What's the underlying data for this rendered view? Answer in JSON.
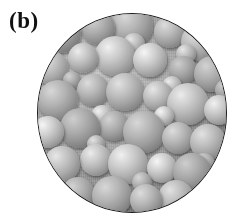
{
  "figure": {
    "panel_label": "(b)",
    "image_type": "circular micrograph of close-packed spherical nanoparticles",
    "background_color": "#ffffff",
    "border_color": "#1d1d1d",
    "circle": {
      "left": 37,
      "top": 13,
      "width": 190,
      "height": 200
    },
    "grayscale": {
      "highlight": "#e2e2e2",
      "midtone": "#a4a4a4",
      "shadow": "#575757",
      "substrate": "#9a9a9a"
    },
    "lighting": "upper-left",
    "particles": [
      {
        "cx": 26,
        "cy": 22,
        "r": 19
      },
      {
        "cx": 62,
        "cy": 16,
        "r": 17
      },
      {
        "cx": 96,
        "cy": 14,
        "r": 21
      },
      {
        "cx": 134,
        "cy": 20,
        "r": 16
      },
      {
        "cx": 164,
        "cy": 30,
        "r": 19
      },
      {
        "cx": 15,
        "cy": 56,
        "r": 17
      },
      {
        "cx": 47,
        "cy": 46,
        "r": 15
      },
      {
        "cx": 79,
        "cy": 44,
        "r": 20
      },
      {
        "cx": 114,
        "cy": 48,
        "r": 17
      },
      {
        "cx": 147,
        "cy": 58,
        "r": 14
      },
      {
        "cx": 176,
        "cy": 62,
        "r": 18
      },
      {
        "cx": 22,
        "cy": 88,
        "r": 20
      },
      {
        "cx": 57,
        "cy": 78,
        "r": 16
      },
      {
        "cx": 89,
        "cy": 80,
        "r": 19
      },
      {
        "cx": 122,
        "cy": 84,
        "r": 15
      },
      {
        "cx": 152,
        "cy": 92,
        "r": 21
      },
      {
        "cx": 183,
        "cy": 98,
        "r": 15
      },
      {
        "cx": 12,
        "cy": 120,
        "r": 16
      },
      {
        "cx": 44,
        "cy": 116,
        "r": 20
      },
      {
        "cx": 78,
        "cy": 114,
        "r": 15
      },
      {
        "cx": 108,
        "cy": 120,
        "r": 21
      },
      {
        "cx": 142,
        "cy": 126,
        "r": 16
      },
      {
        "cx": 172,
        "cy": 130,
        "r": 18
      },
      {
        "cx": 26,
        "cy": 152,
        "r": 18
      },
      {
        "cx": 60,
        "cy": 148,
        "r": 16
      },
      {
        "cx": 92,
        "cy": 152,
        "r": 20
      },
      {
        "cx": 126,
        "cy": 156,
        "r": 15
      },
      {
        "cx": 156,
        "cy": 160,
        "r": 19
      },
      {
        "cx": 42,
        "cy": 182,
        "r": 17
      },
      {
        "cx": 76,
        "cy": 184,
        "r": 20
      },
      {
        "cx": 110,
        "cy": 188,
        "r": 16
      },
      {
        "cx": 140,
        "cy": 186,
        "r": 18
      },
      {
        "cx": 98,
        "cy": 32,
        "r": 11
      },
      {
        "cx": 136,
        "cy": 74,
        "r": 10
      },
      {
        "cx": 66,
        "cy": 104,
        "r": 11
      },
      {
        "cx": 128,
        "cy": 104,
        "r": 10
      },
      {
        "cx": 190,
        "cy": 78,
        "r": 11
      },
      {
        "cx": 36,
        "cy": 68,
        "r": 9
      },
      {
        "cx": 106,
        "cy": 170,
        "r": 10
      },
      {
        "cx": 168,
        "cy": 152,
        "r": 11
      },
      {
        "cx": 60,
        "cy": 132,
        "r": 9
      },
      {
        "cx": 150,
        "cy": 42,
        "r": 10
      }
    ]
  }
}
